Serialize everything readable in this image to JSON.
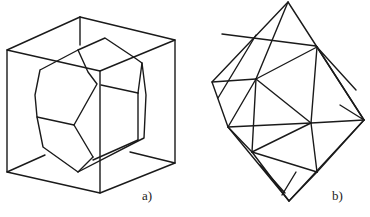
{
  "figure": {
    "panels": [
      {
        "id": "a",
        "label": "a)",
        "description": "Truncated polyhedron inscribed in a cube (wireframe)"
      },
      {
        "id": "b",
        "label": "b)",
        "description": "Octahedron-like triangulated polyhedron (wireframe)"
      }
    ],
    "colors": {
      "line": "#1a1a1a",
      "background": "#ffffff"
    }
  }
}
